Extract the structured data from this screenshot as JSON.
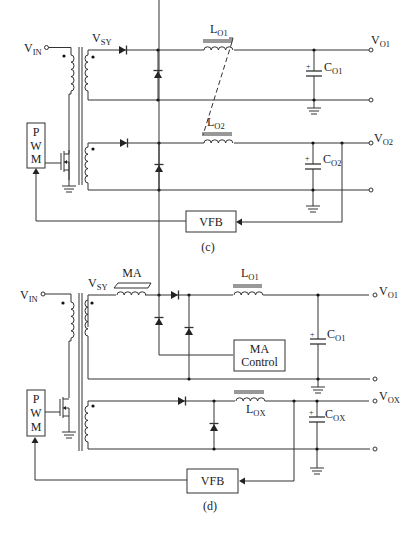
{
  "figure_c": {
    "caption": "(c)",
    "labels": {
      "vin_main": "V",
      "vin_sub": "IN",
      "vsy_main": "V",
      "vsy_sub": "SY",
      "lo1_main": "L",
      "lo1_sub": "O1",
      "lo2_main": "L",
      "lo2_sub": "O2",
      "co1_main": "C",
      "co1_sub": "O1",
      "co2_main": "C",
      "co2_sub": "O2",
      "vo1_main": "V",
      "vo1_sub": "O1",
      "vo2_main": "V",
      "vo2_sub": "O2",
      "pwm": [
        "P",
        "W",
        "M"
      ],
      "vfb": "VFB",
      "plus": "+"
    }
  },
  "figure_d": {
    "caption": "(d)",
    "labels": {
      "vin_main": "V",
      "vin_sub": "IN",
      "vsy_main": "V",
      "vsy_sub": "SY",
      "ma": "MA",
      "lo1_main": "L",
      "lo1_sub": "O1",
      "lox_main": "L",
      "lox_sub": "OX",
      "co1_main": "C",
      "co1_sub": "O1",
      "cox_main": "C",
      "cox_sub": "OX",
      "vo1_main": "V",
      "vo1_sub": "O1",
      "vox_main": "V",
      "vox_sub": "OX",
      "ma_control_line1": "MA",
      "ma_control_line2": "Control",
      "pwm": [
        "P",
        "W",
        "M"
      ],
      "vfb": "VFB",
      "plus": "+"
    }
  },
  "colors": {
    "line": "#333333",
    "background": "#ffffff"
  }
}
